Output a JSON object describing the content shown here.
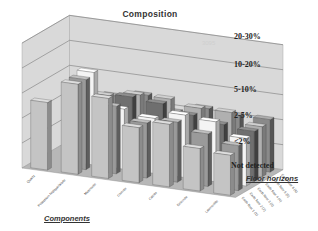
{
  "chart_data": {
    "type": "bar",
    "subtype": "3d-clustered-bar",
    "title": "Composition",
    "xlabel": "Components",
    "zlabel": "Floor horizons",
    "ylabel": "",
    "y_levels": [
      "Not detected",
      "<2%",
      "2-5%",
      "5-10%",
      "10-20%",
      "20-30%"
    ],
    "y_level_note": "ordinal scale: 0=Not detected, 1=<2%, 2=2-5%, 3=5-10%, 4=10-20%, 5=20-30%",
    "categories": [
      "Quartz",
      "Potassium feldspar/albite",
      "Muscovite",
      "Chlorite",
      "Calcite",
      "Dolomite",
      "Laumontite"
    ],
    "series": [
      {
        "name": "Earth floor 1 (1)",
        "values": [
          2.7,
          3.6,
          3.2,
          2.2,
          2.5,
          1.7,
          1.6
        ]
      },
      {
        "name": "Earth floor 2 (2)",
        "values": [
          0,
          3.6,
          2.7,
          2.2,
          2.4,
          2.1,
          1.8
        ]
      },
      {
        "name": "Earth floor 3 (3)",
        "values": [
          0,
          3.7,
          2.4,
          2.2,
          2.5,
          2.4,
          1.9
        ]
      },
      {
        "name": "Earth floor 4 (4)",
        "values": [
          0,
          2.3,
          2.7,
          2.6,
          2.3,
          2.1,
          2.0
        ]
      },
      {
        "name": "Earth floor 5 (5)",
        "values": [
          0,
          2.4,
          2.6,
          2.6,
          2.4,
          2.4,
          2.0
        ]
      },
      {
        "name": "Earth floor 6 (6)",
        "values": [
          0,
          2.2,
          2.4,
          1.9,
          2.2,
          2.1,
          2.1
        ]
      }
    ],
    "ylim": [
      0,
      5
    ],
    "grid": true,
    "legend": "none (series labelled along depth axis)"
  },
  "labels": {
    "title": "Composition",
    "components": "Components",
    "floor_horizons": "Floor horizons",
    "watermark": "3095",
    "yticks": [
      "20-30%",
      "10-20%",
      "5-10%",
      "2-5%",
      "<2%",
      "Not detected"
    ]
  }
}
